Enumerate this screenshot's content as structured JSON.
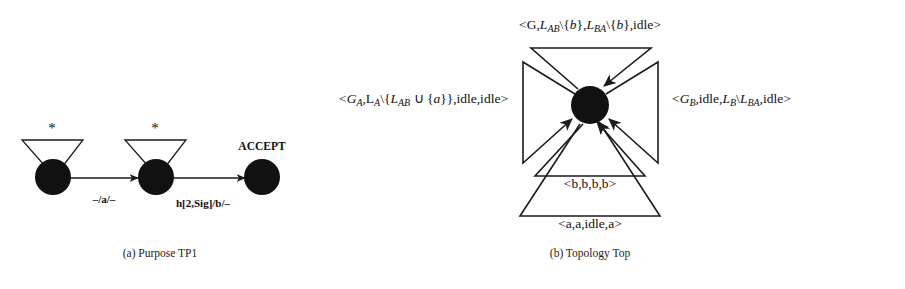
{
  "figure": {
    "panels": [
      {
        "id": "a",
        "caption": "(a) Purpose TP1",
        "accept_label": "ACCEPT",
        "self_loop_label": "*",
        "edges": [
          {
            "label": "–/a/–"
          },
          {
            "label": "h[2,Sig]/b/–"
          }
        ],
        "states": [
          {
            "name": "s0"
          },
          {
            "name": "s1"
          },
          {
            "name": "s2"
          }
        ]
      },
      {
        "id": "b",
        "caption": "(b) Topology Top",
        "transitions": {
          "top": {
            "open": "<",
            "t1": "G,",
            "t2": "L",
            "t2sub": "AB",
            "t3": "\\{",
            "t4": "b",
            "t5": "},",
            "t6": "L",
            "t6sub": "BA",
            "t7": "\\{",
            "t8": "b",
            "t9": "},idle",
            "close": ">",
            "plain": "<G,L_AB\\{b},L_BA\\{b},idle>"
          },
          "left": {
            "open": "<",
            "t1": "G",
            "t1sub": "A",
            "t2": ",L",
            "t2sub": "A",
            "t3": "\\{",
            "t4": "L",
            "t4sub": "AB",
            "t5": " ∪ {",
            "t6": "a",
            "t7": "}},idle,idle",
            "close": ">",
            "plain": "<G_A,L_A\\{L_AB ∪ {a}},idle,idle>"
          },
          "right": {
            "open": "<",
            "t1": "G",
            "t1sub": "B",
            "t2": ",idle,",
            "t3": "L",
            "t3sub": "B",
            "t4": "\\",
            "t5": "L",
            "t5sub": "BA",
            "t6": ",idle",
            "close": ">",
            "plain": "<G_B,idle,L_B\\L_BA,idle>"
          },
          "bottom_inner": {
            "plain": "<b,b,b,b>"
          },
          "bottom_outer": {
            "plain": "<a,a,idle,a>"
          }
        }
      }
    ]
  }
}
